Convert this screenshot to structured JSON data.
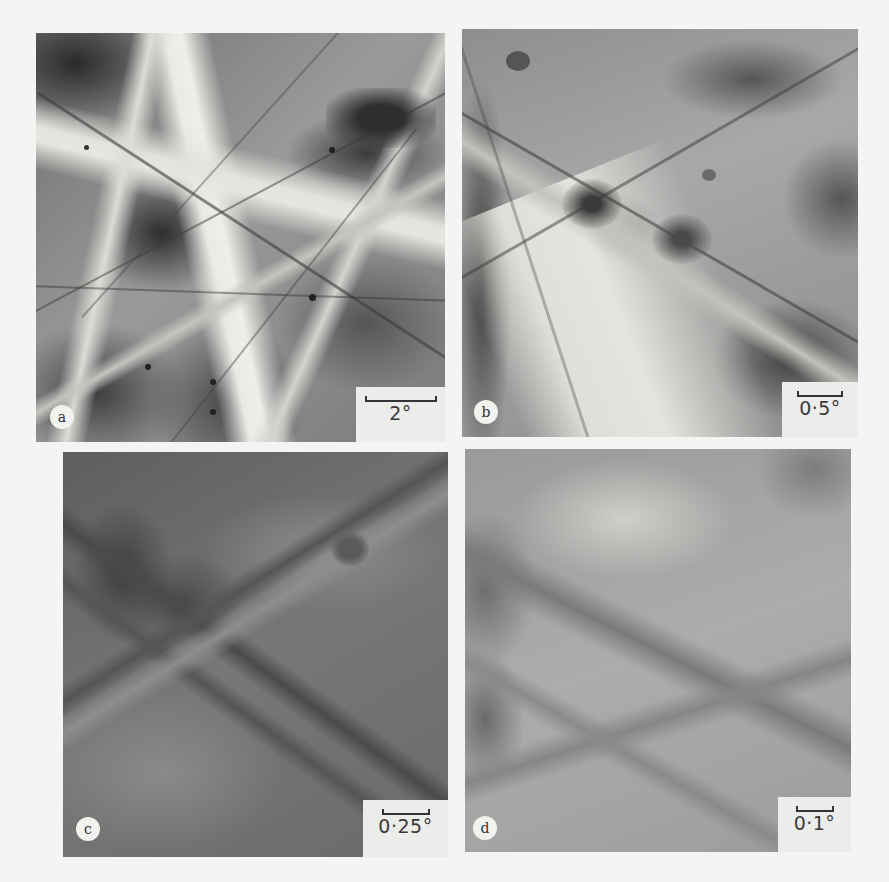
{
  "figure": {
    "panels": [
      {
        "id": "a",
        "label": "a",
        "scale_bar": "2°"
      },
      {
        "id": "b",
        "label": "b",
        "scale_bar": "0·5°"
      },
      {
        "id": "c",
        "label": "c",
        "scale_bar": "0·25°"
      },
      {
        "id": "d",
        "label": "d",
        "scale_bar": "0·1°"
      }
    ]
  },
  "colors": {
    "page_background": "#f4f4f2",
    "label_circle": "#f2f2ef",
    "scale_box": "#ececea",
    "text": "#333333"
  }
}
